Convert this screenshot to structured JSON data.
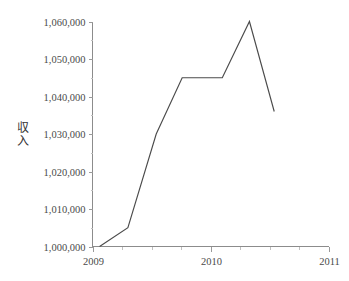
{
  "chart_data": {
    "type": "line",
    "title": "",
    "xlabel": "",
    "ylabel": "収入",
    "ylabel_chars": [
      "収",
      "入"
    ],
    "xlim": [
      2009.0,
      2011.0
    ],
    "ylim": [
      1000000,
      1060000
    ],
    "grid": false,
    "legend": null,
    "x_tick_labels": [
      "2009",
      "2010",
      "2011"
    ],
    "x_tick_values": [
      2009,
      2010,
      2011
    ],
    "x_minor_tick_values": [
      2009.25,
      2009.5,
      2009.75,
      2010.25,
      2010.5,
      2010.75
    ],
    "y_tick_labels": [
      "1,000,000",
      "1,010,000",
      "1,020,000",
      "1,030,000",
      "1,040,000",
      "1,050,000",
      "1,060,000"
    ],
    "y_tick_values": [
      1000000,
      1010000,
      1020000,
      1030000,
      1040000,
      1050000,
      1060000
    ],
    "y_minor_tick_values": [
      1005000,
      1015000,
      1025000,
      1035000,
      1045000,
      1055000
    ],
    "series": [
      {
        "name": "収入",
        "color": "#4b4b4b",
        "x": [
          2009.06,
          2009.3,
          2009.54,
          2009.76,
          2010.1,
          2010.33,
          2010.54
        ],
        "values": [
          1000000,
          1005000,
          1030000,
          1045000,
          1045000,
          1060000,
          1036000
        ]
      }
    ]
  },
  "axes": {
    "y_axis_name": "income-axis",
    "x_axis_name": "year-axis",
    "spine_color": "#8c8c8c",
    "tick_color": "#9a9a9a",
    "background": "#ffffff"
  }
}
